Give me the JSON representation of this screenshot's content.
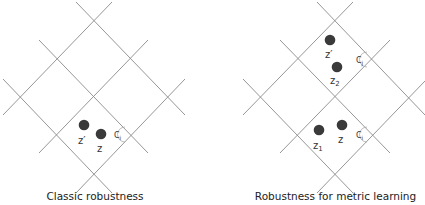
{
  "panels": [
    {
      "caption": "Classic robustness",
      "points": [
        {
          "label": "z'",
          "x": 84,
          "y": 125
        },
        {
          "label": "z",
          "x": 101,
          "y": 134
        }
      ],
      "cell_marker": {
        "label": "Ci",
        "x": 120,
        "y": 135
      }
    },
    {
      "caption": "Robustness for metric learning",
      "points": [
        {
          "label": "z'",
          "x": 330,
          "y": 40
        },
        {
          "label": "z2",
          "x": 337,
          "y": 67
        },
        {
          "label": "z1",
          "x": 319,
          "y": 130
        },
        {
          "label": "z",
          "x": 342,
          "y": 125
        }
      ],
      "cell_markers": [
        {
          "label": "Cj",
          "x": 362,
          "y": 60
        },
        {
          "label": "Ci",
          "x": 362,
          "y": 135
        }
      ]
    }
  ],
  "colors": {
    "grid": "#8a8a8a",
    "point": "#3a3a3a",
    "background": "#ffffff"
  }
}
